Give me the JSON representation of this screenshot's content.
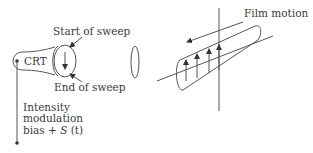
{
  "labels": {
    "start_of_sweep": "Start of sweep",
    "end_of_sweep": "End of sweep",
    "crt": "CRT",
    "intensity": "Intensity",
    "modulation": "modulation",
    "bias": "bias + ",
    "signal": "S",
    "signal_arg": " (t)",
    "film_motion": "Film motion"
  },
  "colors": {
    "line": "#555555",
    "text": "#3a3a3a",
    "background": "#ffffff"
  }
}
